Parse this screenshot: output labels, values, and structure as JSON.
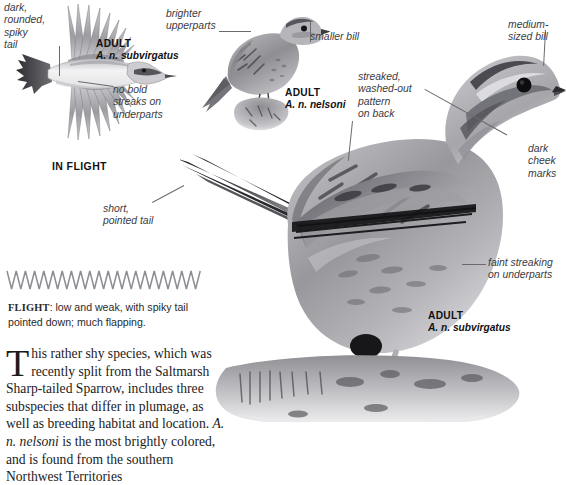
{
  "page": {
    "species_context": "Nelson's Sparrow field guide plate",
    "background_color": "#ffffff",
    "ink_color": "#231f20",
    "label_color": "#3b3b3f",
    "leader_color": "#6a6a6e"
  },
  "labels": [
    {
      "id": "dark-rounded-spiky-tail",
      "text": "dark,\nrounded,\nspiky\ntail"
    },
    {
      "id": "no-bold-streaks",
      "text": "no bold\nstreaks on\nunderparts"
    },
    {
      "id": "brighter-upperparts",
      "text": "brighter\nupperparts"
    },
    {
      "id": "smaller-bill",
      "text": "smaller bill"
    },
    {
      "id": "medium-sized-bill",
      "text": "medium-\nsized bill"
    },
    {
      "id": "streaked-washed-out",
      "text": "streaked,\nwashed-out\npattern\non back"
    },
    {
      "id": "dark-cheek-marks",
      "text": "dark\ncheek\nmarks"
    },
    {
      "id": "faint-streaking",
      "text": "faint streaking\non underparts"
    },
    {
      "id": "short-pointed-tail",
      "text": "short,\npointed tail"
    }
  ],
  "captions": {
    "flight_adult": {
      "line1": "ADULT",
      "line2": "A. n. subvirgatus"
    },
    "nelsoni_adult": {
      "line1": "ADULT",
      "line2": "A. n. nelsoni"
    },
    "main_adult": {
      "line1": "ADULT",
      "line2": "A. n. subvirgatus"
    },
    "in_flight": "IN FLIGHT"
  },
  "flight_diagram": {
    "heading": "FLIGHT",
    "text": ": low and weak, with spiky tail pointed down; much flapping.",
    "zigzag_peaks": 21,
    "stroke_color": "#8d8d92"
  },
  "body_text": {
    "dropcap": "T",
    "paragraph": "his rather shy species, which was recently split from the Saltmarsh Sharp-tailed Sparrow, includes three subspecies that differ in plumage, as well as breeding habitat and location. ",
    "italic_name": "A. n. nelsoni",
    "paragraph_2": " is the most brightly colored, and is found from the southern Northwest Territories"
  }
}
